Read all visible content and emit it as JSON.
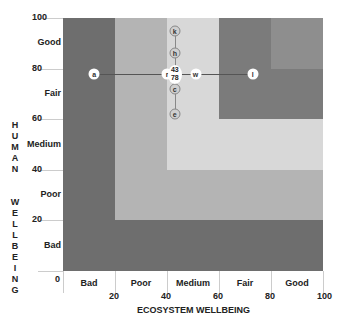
{
  "chart_data": {
    "type": "scatter",
    "title": "",
    "xlabel": "ECOSYSTEM WELLBEING",
    "ylabel": "HUMAN WELLBEING",
    "xlim": [
      0,
      100
    ],
    "ylim": [
      0,
      100
    ],
    "x_ticks": [
      "0",
      "20",
      "40",
      "60",
      "80",
      "100"
    ],
    "y_ticks": [
      "100",
      "80",
      "60",
      "40",
      "20",
      "0"
    ],
    "x_categories": [
      "Bad",
      "Poor",
      "Medium",
      "Fair",
      "Good"
    ],
    "y_categories": [
      "Good",
      "Fair",
      "Medium",
      "Poor",
      "Bad"
    ],
    "bands": [
      {
        "name": "bad",
        "x_from": 0,
        "y_from": 0,
        "color": "#6e6e6e"
      },
      {
        "name": "poor",
        "x_from": 20,
        "y_from": 20,
        "color": "#b4b4b4"
      },
      {
        "name": "medium",
        "x_from": 40,
        "y_from": 40,
        "color": "#d8d8d8"
      },
      {
        "name": "fair",
        "x_from": 60,
        "y_from": 60,
        "color": "#7b7b7b"
      },
      {
        "name": "good",
        "x_from": 80,
        "y_from": 80,
        "color": "#8e8e8e"
      }
    ],
    "points": [
      {
        "label": "a",
        "x": 12,
        "y": 78,
        "style": "white"
      },
      {
        "label": "r",
        "x": 40,
        "y": 78,
        "style": "white"
      },
      {
        "label": "w",
        "x": 51,
        "y": 78,
        "style": "white"
      },
      {
        "label": "l",
        "x": 73,
        "y": 78,
        "style": "white"
      },
      {
        "label": "k",
        "x": 43,
        "y": 95,
        "style": "grey"
      },
      {
        "label": "h",
        "x": 43,
        "y": 86,
        "style": "grey"
      },
      {
        "label": "c",
        "x": 43,
        "y": 72,
        "style": "grey"
      },
      {
        "label": "e",
        "x": 43,
        "y": 62,
        "style": "grey"
      }
    ],
    "center_marker": {
      "x": 43,
      "y": 78,
      "label_top": "43",
      "label_bottom": "78"
    },
    "grid": false,
    "legend": "none"
  }
}
